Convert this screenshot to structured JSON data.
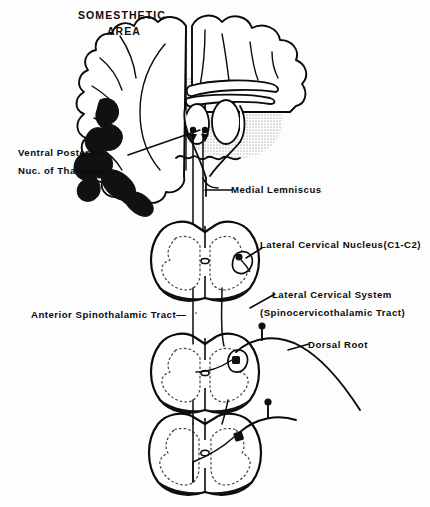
{
  "figure": {
    "title_line1": "SOMESTHETIC",
    "title_line2": "AREA"
  },
  "colors": {
    "background": "#fdfdfd",
    "ink": "#0b0b0b",
    "shading_gray": "#d9d9d9",
    "white_matter_fill": "#ffffff",
    "black_fill": "#111111",
    "dashed_gray_matter": "#3a3a3a"
  },
  "labels": [
    {
      "id": "somesthetic-area",
      "text_line1": "SOMESTHETIC",
      "text_line2": "AREA",
      "x": 78,
      "y": 10,
      "style": "title"
    },
    {
      "id": "ventral-posterior-nucleus",
      "text_line1": "Ventral Posterior",
      "text_line2": "Nuc. of Thalamus",
      "x": 18,
      "y": 148,
      "style": "main"
    },
    {
      "id": "medial-lemniscus",
      "text_line1": "Medial Lemniscus",
      "text_line2": "",
      "x": 231,
      "y": 185,
      "style": "right"
    },
    {
      "id": "lateral-cervical-nucleus",
      "text_line1": "Lateral Cervical Nucleus(C1-C2)",
      "text_line2": "",
      "x": 260,
      "y": 240,
      "style": "right"
    },
    {
      "id": "lateral-cervical-system",
      "text_line1": "Lateral Cervical System",
      "text_line2": "(Spinocervicothalamic Tract)",
      "x": 272,
      "y": 290,
      "style": "right"
    },
    {
      "id": "anterior-spinothalamic-tract",
      "text_line1": "Anterior Spinothalamic Tract—",
      "text_line2": "",
      "x": 31,
      "y": 310,
      "style": "main"
    },
    {
      "id": "dorsal-root",
      "text_line1": "Dorsal Root",
      "text_line2": "",
      "x": 308,
      "y": 340,
      "style": "right"
    }
  ],
  "structures": [
    {
      "id": "cerebral-cortex",
      "name": "Cerebral cortex (coronal section)"
    },
    {
      "id": "thalamus-shading",
      "name": "Thalamic gray shading"
    },
    {
      "id": "ventral-posterior-nucleus-black",
      "name": "Ventral posterior nucleus (solid black)"
    },
    {
      "id": "brainstem",
      "name": "Brainstem / midbrain outline"
    },
    {
      "id": "cord-c1c2",
      "name": "Spinal cord section C1-C2"
    },
    {
      "id": "cord-mid",
      "name": "Spinal cord section mid-cervical"
    },
    {
      "id": "cord-lower",
      "name": "Spinal cord section lower"
    },
    {
      "id": "tract-line-left",
      "name": "Ascending tract line (left)"
    },
    {
      "id": "tract-line-right",
      "name": "Ascending tract line (right)"
    },
    {
      "id": "dorsal-root-fiber",
      "name": "Dorsal root afferent fiber"
    }
  ]
}
